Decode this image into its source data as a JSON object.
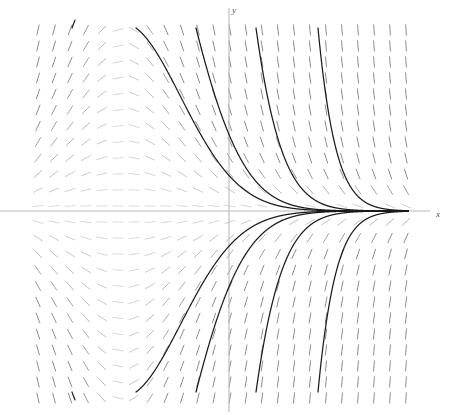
{
  "figure": {
    "kind": "slope-field-with-solution-curves",
    "background_color": "#ffffff",
    "width": 451,
    "height": 415
  },
  "axes": {
    "x_axis": {
      "label": "x",
      "label_position": {
        "x": 436,
        "y": 217
      },
      "color": "#b9b9b9",
      "pixel_y": 211,
      "from_px": 0,
      "to_px": 430
    },
    "y_axis": {
      "label": "y",
      "label_position": {
        "x": 232,
        "y": 13
      },
      "color": "#b9b9b9",
      "pixel_x": 229,
      "from_px": 8,
      "to_px": 412
    }
  },
  "chart_data": {
    "type": "line",
    "title": "",
    "xlabel": "x",
    "ylabel": "y",
    "grid": false,
    "legend": null,
    "xlim": [
      -6,
      7
    ],
    "ylim": [
      -6,
      6
    ],
    "origin_px": {
      "x": 229,
      "y": 211
    },
    "scale_px_per_unit": {
      "x": 32,
      "y": 32
    },
    "slope_field": {
      "description": "short line segments showing dy/dx at each grid point; slope is negative for y>0 and positive for y<0, magnitude grows with distance from the x-axis and with x",
      "formula": "dy/dx = -y * (1 + 0.30*x)",
      "tick_color": "#808080",
      "tick_length_px": 11,
      "grid_start_px": {
        "x": 38,
        "y": 30
      },
      "grid_spacing_px": {
        "x": 16,
        "y": 16
      },
      "grid_count": {
        "columns": 24,
        "rows": 24
      }
    },
    "series": [
      {
        "name": "curve-1",
        "start_px": {
          "x": 72,
          "y": 28
        },
        "c": 5.2,
        "branch": "upper"
      },
      {
        "name": "curve-2",
        "start_px": {
          "x": 136,
          "y": 28
        },
        "c": 3.1,
        "branch": "upper"
      },
      {
        "name": "curve-3",
        "start_px": {
          "x": 196,
          "y": 28
        },
        "c": 2.0,
        "branch": "upper"
      },
      {
        "name": "curve-4",
        "start_px": {
          "x": 256,
          "y": 28
        },
        "c": 1.25,
        "branch": "upper"
      },
      {
        "name": "curve-5",
        "start_px": {
          "x": 318,
          "y": 28
        },
        "c": 0.7,
        "branch": "upper"
      },
      {
        "name": "curve-6",
        "start_px": {
          "x": 72,
          "y": 392
        },
        "c": -5.2,
        "branch": "lower"
      },
      {
        "name": "curve-7",
        "start_px": {
          "x": 136,
          "y": 392
        },
        "c": -3.1,
        "branch": "lower"
      },
      {
        "name": "curve-8",
        "start_px": {
          "x": 196,
          "y": 392
        },
        "c": -2.0,
        "branch": "lower"
      },
      {
        "name": "curve-9",
        "start_px": {
          "x": 256,
          "y": 392
        },
        "c": -1.25,
        "branch": "lower"
      },
      {
        "name": "curve-10",
        "start_px": {
          "x": 318,
          "y": 392
        },
        "c": -0.7,
        "branch": "lower"
      }
    ]
  }
}
